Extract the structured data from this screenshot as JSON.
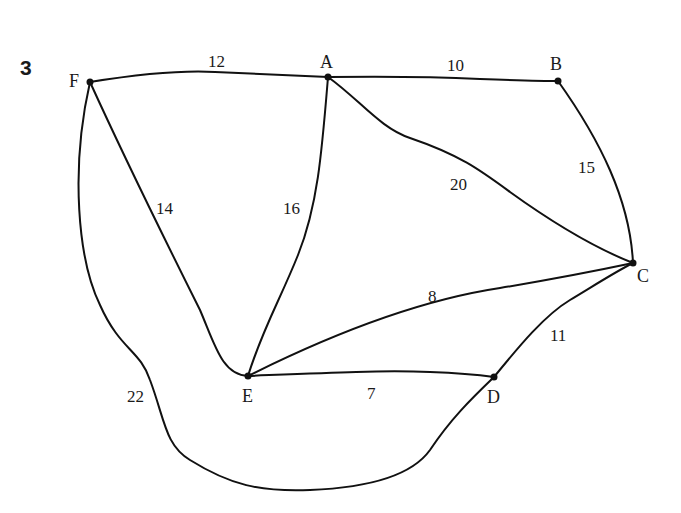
{
  "question_number": "3",
  "graph": {
    "nodes": [
      {
        "id": "F",
        "label": "F"
      },
      {
        "id": "A",
        "label": "A"
      },
      {
        "id": "B",
        "label": "B"
      },
      {
        "id": "C",
        "label": "C"
      },
      {
        "id": "D",
        "label": "D"
      },
      {
        "id": "E",
        "label": "E"
      }
    ],
    "edges": [
      {
        "from": "F",
        "to": "A",
        "weight": "12"
      },
      {
        "from": "A",
        "to": "B",
        "weight": "10"
      },
      {
        "from": "B",
        "to": "C",
        "weight": "15"
      },
      {
        "from": "A",
        "to": "C",
        "weight": "20"
      },
      {
        "from": "F",
        "to": "E",
        "weight": "14"
      },
      {
        "from": "A",
        "to": "E",
        "weight": "16"
      },
      {
        "from": "E",
        "to": "C",
        "weight": "8"
      },
      {
        "from": "D",
        "to": "C",
        "weight": "11"
      },
      {
        "from": "E",
        "to": "D",
        "weight": "7"
      },
      {
        "from": "F",
        "to": "D",
        "weight": "22"
      }
    ]
  }
}
